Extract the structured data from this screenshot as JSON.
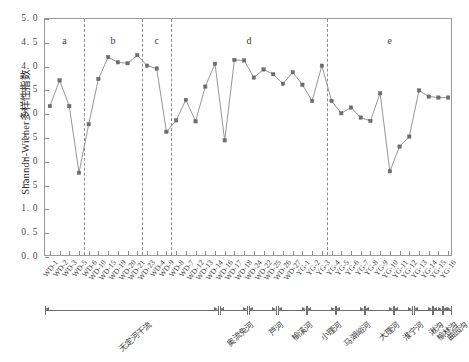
{
  "chart_data": {
    "type": "line",
    "title": "",
    "xlabel": "",
    "ylabel": "Shannon-Wiener多样性指数",
    "ylim": [
      0.0,
      5.0
    ],
    "ytick_labels": [
      "0. 0",
      "0. 5",
      "1. 0",
      "1. 5",
      "2. 0",
      "2. 5",
      "3. 0",
      "3. 5",
      "4. 0",
      "4. 5",
      "5. 0"
    ],
    "ytick_values": [
      0.0,
      0.5,
      1.0,
      1.5,
      2.0,
      2.5,
      3.0,
      3.5,
      4.0,
      4.5,
      5.0
    ],
    "grid": false,
    "legend": "none",
    "marker": "square",
    "series_color": "#6e6e6e",
    "line_color": "#8a8a8a",
    "categories": [
      "WD-1",
      "WD-2",
      "WD-3",
      "WD-5",
      "WD-6",
      "WD-10",
      "WD-15",
      "WD-19",
      "WD-20",
      "WD-21",
      "WD-23",
      "WD-4",
      "WD-9",
      "WD-8",
      "WD-7",
      "WD-12",
      "WD-13",
      "WD-14",
      "WD-16",
      "WD-17",
      "WD-18",
      "WD-24",
      "WD-22",
      "WD-25",
      "WD-26",
      "WD-27",
      "YG-1",
      "YG-2",
      "YG-3",
      "YG-4",
      "YG-5",
      "YG-6",
      "YG-7",
      "YG-8",
      "YG-9",
      "YG-10",
      "YG-11",
      "YG-12",
      "YG-13",
      "YG-14",
      "YG-15",
      "YG-16"
    ],
    "values": [
      3.17,
      3.71,
      3.17,
      1.77,
      2.79,
      3.74,
      4.2,
      4.09,
      4.07,
      4.24,
      4.02,
      3.96,
      2.63,
      2.87,
      3.3,
      2.85,
      3.58,
      4.06,
      2.45,
      4.14,
      4.13,
      3.77,
      3.94,
      3.84,
      3.64,
      3.88,
      3.62,
      3.28,
      4.02,
      3.28,
      3.02,
      3.14,
      2.93,
      2.86,
      3.44,
      1.8,
      2.32,
      2.53,
      3.5,
      3.37,
      3.35,
      3.35
    ],
    "zones": [
      {
        "label": "a",
        "start_index": 0,
        "end_index": 3
      },
      {
        "label": "b",
        "start_index": 4,
        "end_index": 9
      },
      {
        "label": "c",
        "start_index": 10,
        "end_index": 12
      },
      {
        "label": "d",
        "start_index": 13,
        "end_index": 28
      },
      {
        "label": "e",
        "start_index": 29,
        "end_index": 41
      }
    ],
    "zone_dividers_after_index": [
      3,
      9,
      12,
      28
    ],
    "groups": [
      {
        "label": "无定河干流",
        "start_index": 0,
        "end_index": 17
      },
      {
        "label": "奥流兔河",
        "start_index": 18,
        "end_index": 20
      },
      {
        "label": "芦河",
        "start_index": 21,
        "end_index": 23
      },
      {
        "label": "榆溪河",
        "start_index": 24,
        "end_index": 26
      },
      {
        "label": "小理河",
        "start_index": 27,
        "end_index": 29
      },
      {
        "label": "马湖峪河",
        "start_index": 30,
        "end_index": 32
      },
      {
        "label": "大理河",
        "start_index": 33,
        "end_index": 35
      },
      {
        "label": "淮宁河",
        "start_index": 36,
        "end_index": 37
      },
      {
        "label": "湫沟",
        "start_index": 38,
        "end_index": 39
      },
      {
        "label": "榆林沟",
        "start_index": 40,
        "end_index": 40
      },
      {
        "label": "曲园沟",
        "start_index": 41,
        "end_index": 41
      }
    ]
  }
}
